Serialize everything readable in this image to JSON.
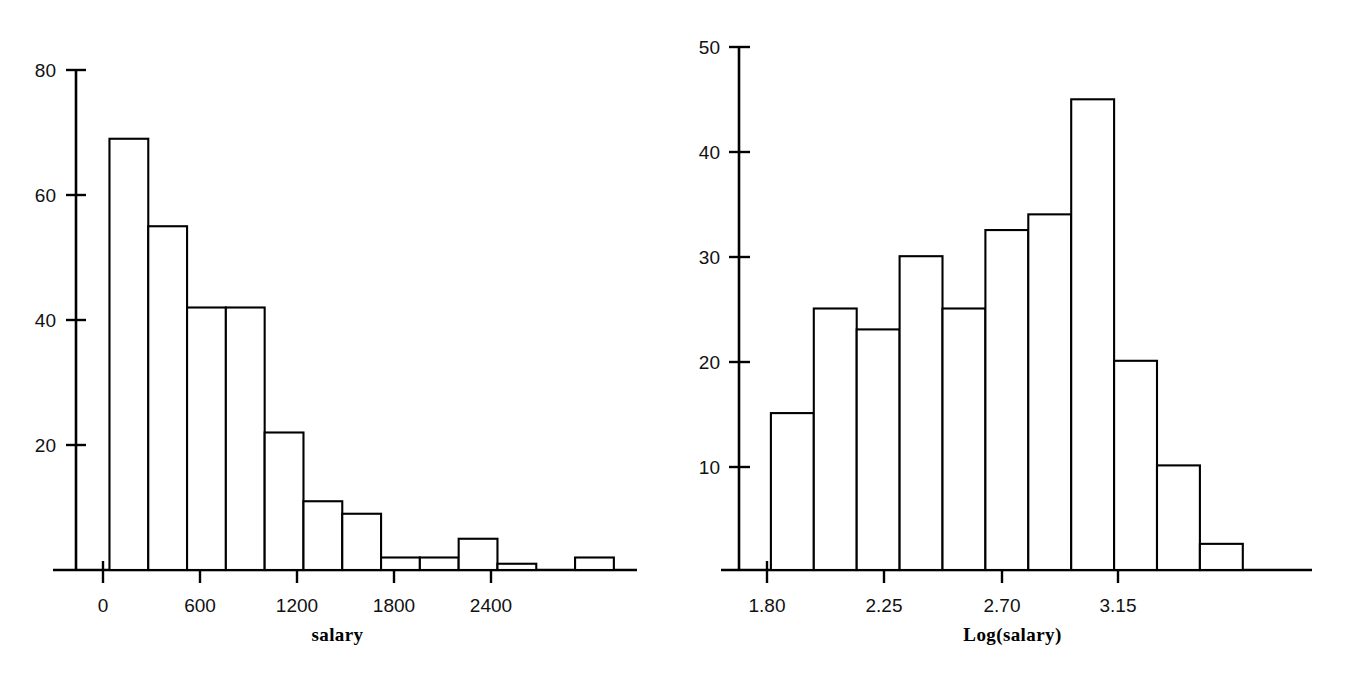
{
  "figure": {
    "background_color": "#ffffff",
    "ink_color": "#000000",
    "panel_count": 2
  },
  "chart_data": [
    {
      "type": "bar",
      "subtype": "histogram",
      "panel": "left",
      "title": "",
      "xlabel": "salary",
      "ylabel": "",
      "grid": false,
      "legend": null,
      "xlim": [
        -120,
        2760
      ],
      "ylim": [
        0,
        80
      ],
      "xticks": [
        0,
        600,
        1200,
        1800,
        2400
      ],
      "xtick_labels": [
        "0",
        "600",
        "1200",
        "1800",
        "2400"
      ],
      "yticks": [
        20,
        40,
        60,
        80
      ],
      "ytick_labels": [
        "20",
        "40",
        "60",
        "80"
      ],
      "bin_width": 240,
      "bin_edges": [
        40,
        280,
        520,
        760,
        1000,
        1240,
        1480,
        1720,
        1960,
        2200,
        2440,
        2680,
        2920
      ],
      "values": [
        69,
        55,
        42,
        42,
        22,
        11,
        9,
        2,
        2,
        5,
        1,
        0,
        2
      ],
      "bars": [
        {
          "x0": 40,
          "x1": 280,
          "height": 69
        },
        {
          "x0": 280,
          "x1": 520,
          "height": 55
        },
        {
          "x0": 520,
          "x1": 760,
          "height": 42
        },
        {
          "x0": 760,
          "x1": 1000,
          "height": 42
        },
        {
          "x0": 1000,
          "x1": 1240,
          "height": 22
        },
        {
          "x0": 1240,
          "x1": 1480,
          "height": 11
        },
        {
          "x0": 1480,
          "x1": 1720,
          "height": 9
        },
        {
          "x0": 1720,
          "x1": 1960,
          "height": 2
        },
        {
          "x0": 1960,
          "x1": 2200,
          "height": 2
        },
        {
          "x0": 2200,
          "x1": 2440,
          "height": 5
        },
        {
          "x0": 2440,
          "x1": 2680,
          "height": 1
        },
        {
          "x0": 2920,
          "x1": 3160,
          "height": 2
        }
      ]
    },
    {
      "type": "bar",
      "subtype": "histogram",
      "panel": "right",
      "title": "",
      "xlabel": "Log(salary)",
      "ylabel": "",
      "grid": false,
      "legend": null,
      "xlim": [
        1.68,
        3.68
      ],
      "ylim": [
        0,
        50
      ],
      "xticks": [
        1.8,
        2.25,
        2.7,
        3.15
      ],
      "xtick_labels": [
        "1.80",
        "2.25",
        "2.70",
        "3.15"
      ],
      "yticks": [
        10,
        20,
        30,
        40,
        50
      ],
      "ytick_labels": [
        "10",
        "20",
        "30",
        "40",
        "50"
      ],
      "bin_width": 0.165,
      "bin_edges": [
        1.815,
        1.98,
        2.145,
        2.31,
        2.475,
        2.64,
        2.805,
        2.97,
        3.135,
        3.3,
        3.465,
        3.63
      ],
      "values": [
        15,
        25,
        23,
        30,
        25,
        32.5,
        34,
        45,
        20,
        10,
        2.5
      ],
      "bars": [
        {
          "x0": 1.815,
          "x1": 1.98,
          "height": 15
        },
        {
          "x0": 1.98,
          "x1": 2.145,
          "height": 25
        },
        {
          "x0": 2.145,
          "x1": 2.31,
          "height": 23
        },
        {
          "x0": 2.31,
          "x1": 2.475,
          "height": 30
        },
        {
          "x0": 2.475,
          "x1": 2.64,
          "height": 25
        },
        {
          "x0": 2.64,
          "x1": 2.805,
          "height": 32.5
        },
        {
          "x0": 2.805,
          "x1": 2.97,
          "height": 34
        },
        {
          "x0": 2.97,
          "x1": 3.135,
          "height": 45
        },
        {
          "x0": 3.135,
          "x1": 3.3,
          "height": 20
        },
        {
          "x0": 3.3,
          "x1": 3.465,
          "height": 10
        },
        {
          "x0": 3.465,
          "x1": 3.63,
          "height": 2.5
        }
      ]
    }
  ],
  "left_panel": {
    "xlabel": "salary",
    "xtick_labels": [
      "0",
      "600",
      "1200",
      "1800",
      "2400"
    ],
    "ytick_labels": [
      "80",
      "60",
      "40",
      "20"
    ]
  },
  "right_panel": {
    "xlabel": "Log(salary)",
    "xtick_labels": [
      "1.80",
      "2.25",
      "2.70",
      "3.15"
    ],
    "ytick_labels": [
      "50",
      "40",
      "30",
      "20",
      "10"
    ]
  }
}
